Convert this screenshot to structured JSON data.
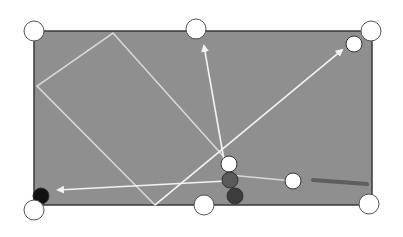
{
  "diagram": {
    "type": "billiards-shot-diagram",
    "colors": {
      "background": "#ffffff",
      "felt": "#8f8f8f",
      "rail": "#3a3a3a",
      "path_line": "#d8d8d8",
      "arrow": "#f2f2f2",
      "pocket_fill": "#ffffff",
      "pocket_stroke": "#555555",
      "cue_stick": "#5e5e5e"
    },
    "table": {
      "x": 34,
      "y": 31,
      "width": 338,
      "height": 174
    },
    "pockets": [
      {
        "name": "top-left",
        "cx": 34,
        "cy": 31
      },
      {
        "name": "top-middle",
        "cx": 196,
        "cy": 29
      },
      {
        "name": "top-right",
        "cx": 371,
        "cy": 31
      },
      {
        "name": "bottom-left",
        "cx": 34,
        "cy": 210
      },
      {
        "name": "bottom-middle",
        "cx": 204,
        "cy": 205
      },
      {
        "name": "bottom-right",
        "cx": 369,
        "cy": 204
      }
    ],
    "balls": [
      {
        "name": "white-object-ball-top-right",
        "cx": 354,
        "cy": 44,
        "fill": "#ffffff"
      },
      {
        "name": "white-object-ball-cluster",
        "cx": 229,
        "cy": 164,
        "fill": "#ffffff"
      },
      {
        "name": "gray-ball",
        "cx": 230,
        "cy": 180,
        "fill": "#5a5a5a"
      },
      {
        "name": "dark-gray-ball",
        "cx": 235,
        "cy": 196,
        "fill": "#3c3c3c"
      },
      {
        "name": "cue-ball",
        "cx": 293,
        "cy": 181,
        "fill": "#ffffff"
      },
      {
        "name": "black-ball",
        "cx": 41,
        "cy": 196,
        "fill": "#111111"
      }
    ],
    "paths": [
      {
        "name": "bank-path",
        "points": [
          [
            224,
            157
          ],
          [
            113,
            33
          ],
          [
            37,
            86
          ],
          [
            155,
            205
          ],
          [
            342,
            50
          ]
        ]
      },
      {
        "name": "cue-ball-path",
        "points": [
          [
            293,
            181
          ],
          [
            229,
            175
          ]
        ]
      }
    ],
    "arrows": [
      {
        "name": "arrow-to-top-middle-pocket",
        "from": [
          224,
          160
        ],
        "to": [
          204,
          46
        ]
      },
      {
        "name": "arrow-to-top-right-ball",
        "from": [
          155,
          205
        ],
        "to": [
          342,
          50
        ]
      },
      {
        "name": "arrow-to-black-ball",
        "from": [
          226,
          181
        ],
        "to": [
          58,
          190
        ]
      }
    ],
    "cue_stick": {
      "from": [
        313,
        180
      ],
      "to": [
        367,
        184
      ]
    }
  }
}
